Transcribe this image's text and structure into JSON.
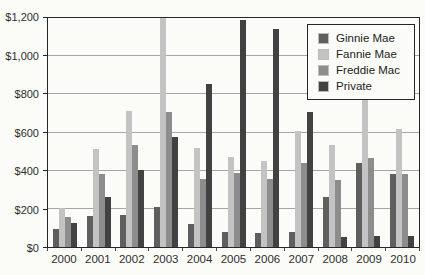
{
  "chart_data": {
    "type": "bar",
    "title": "",
    "xlabel": "",
    "ylabel": "",
    "unit_prefix": "$",
    "categories": [
      "2000",
      "2001",
      "2002",
      "2003",
      "2004",
      "2005",
      "2006",
      "2007",
      "2008",
      "2009",
      "2010"
    ],
    "series": [
      {
        "name": "Ginnie Mae",
        "color": "#5f5f5f",
        "values": [
          95,
          165,
          170,
          210,
          120,
          80,
          75,
          80,
          260,
          440,
          380
        ]
      },
      {
        "name": "Fannie Mae",
        "color": "#c3c3c3",
        "values": [
          205,
          515,
          715,
          1200,
          520,
          470,
          450,
          610,
          535,
          795,
          620
        ]
      },
      {
        "name": "Freddie Mac",
        "color": "#8d8d8d",
        "values": [
          155,
          380,
          535,
          705,
          355,
          390,
          355,
          440,
          350,
          465,
          385
        ]
      },
      {
        "name": "Private",
        "color": "#424242",
        "values": [
          125,
          260,
          405,
          575,
          855,
          1190,
          1140,
          705,
          55,
          60,
          60
        ]
      }
    ],
    "ylim": [
      0,
      1200
    ],
    "yticks": [
      {
        "value": 0,
        "label": "$0"
      },
      {
        "value": 200,
        "label": "$200"
      },
      {
        "value": 400,
        "label": "$400"
      },
      {
        "value": 600,
        "label": "$600"
      },
      {
        "value": 800,
        "label": "$800"
      },
      {
        "value": 1000,
        "label": "$1,000"
      },
      {
        "value": 1200,
        "label": "$1,200"
      }
    ],
    "grid": "horizontal",
    "legend_position": "top-right",
    "note": "2003 Fannie Mae bar is clipped at the top of the axis (reaches $1,200 frame)"
  }
}
